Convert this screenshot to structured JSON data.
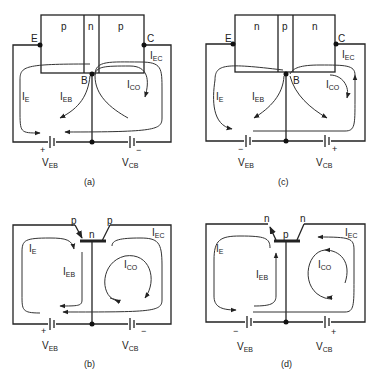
{
  "panels": [
    {
      "id": "a",
      "caption": "(a)",
      "type": "pnp-block",
      "regions": [
        "p",
        "n",
        "p"
      ],
      "terminals": {
        "emitter": "E",
        "base": "B",
        "collector": "C"
      },
      "currents": [
        "I_E",
        "I_EB",
        "I_CO",
        "I_EC"
      ],
      "sources": [
        {
          "name": "V_EB",
          "polarity_left": "+"
        },
        {
          "name": "V_CB",
          "polarity_right": "−"
        }
      ]
    },
    {
      "id": "b",
      "caption": "(b)",
      "type": "pnp-symbol",
      "regions": [
        "p",
        "n",
        "p"
      ],
      "currents": [
        "I_E",
        "I_EB",
        "I_CO",
        "I_EC"
      ],
      "sources": [
        {
          "name": "V_EB",
          "polarity_left": "+"
        },
        {
          "name": "V_CB",
          "polarity_right": "−"
        }
      ]
    },
    {
      "id": "c",
      "caption": "(c)",
      "type": "npn-block",
      "regions": [
        "n",
        "p",
        "n"
      ],
      "terminals": {
        "emitter": "E",
        "base": "B",
        "collector": "C"
      },
      "currents": [
        "I_E",
        "I_EB",
        "I_CO",
        "I_EC"
      ],
      "sources": [
        {
          "name": "V_EB",
          "polarity_left": "−"
        },
        {
          "name": "V_CB",
          "polarity_right": "+"
        }
      ]
    },
    {
      "id": "d",
      "caption": "(d)",
      "type": "npn-symbol",
      "regions": [
        "n",
        "p",
        "n"
      ],
      "currents": [
        "I_E",
        "I_EB",
        "I_CO",
        "I_EC"
      ],
      "sources": [
        {
          "name": "V_EB",
          "polarity_left": "−"
        },
        {
          "name": "V_CB",
          "polarity_right": "+"
        }
      ]
    }
  ],
  "labels": {
    "a": {
      "r1": "p",
      "r2": "n",
      "r3": "p",
      "E": "E",
      "B": "B",
      "C": "C",
      "plus": "+",
      "minus": "−",
      "cap": "(a)"
    },
    "b": {
      "r1": "p",
      "r2": "n",
      "r3": "p",
      "plus": "+",
      "minus": "−",
      "cap": "(b)"
    },
    "c": {
      "r1": "n",
      "r2": "p",
      "r3": "n",
      "E": "E",
      "B": "B",
      "C": "C",
      "plus": "+",
      "minus": "−",
      "cap": "(c)"
    },
    "d": {
      "r1": "n",
      "r2": "p",
      "r3": "n",
      "plus": "+",
      "minus": "−",
      "cap": "(d)"
    }
  },
  "sym": {
    "I": "I",
    "E": "E",
    "EB": "EB",
    "CO": "CO",
    "EC": "EC",
    "V": "V",
    "CB": "CB"
  }
}
